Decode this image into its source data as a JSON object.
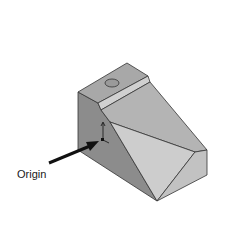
{
  "figure": {
    "label_origin": "Origin",
    "colors": {
      "left_face": "#8c8c8c",
      "top_face": "#a8a8a8",
      "ledge_strip": "#c8c8c8",
      "slope_face": "#b4b4b4",
      "front_triangle": "#cdcdcd",
      "right_triangle": "#c2c2c2",
      "lower_left_face": "#9a9a9a",
      "edge": "#333333",
      "arrow": "#111111"
    }
  }
}
